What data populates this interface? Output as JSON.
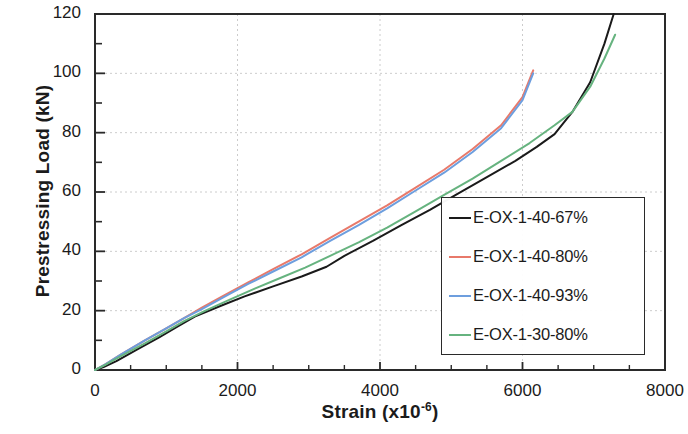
{
  "chart_data": {
    "type": "line",
    "title": "",
    "xlabel": "Strain (x10-6)",
    "xlabel_base": "Strain (x10",
    "xlabel_exponent": "-6",
    "xlabel_close": ")",
    "ylabel": "Prestressing Load (kN)",
    "xlim": [
      0,
      8000
    ],
    "ylim": [
      0,
      120
    ],
    "xticks": [
      0,
      2000,
      4000,
      6000,
      8000
    ],
    "yticks": [
      0,
      20,
      40,
      60,
      80,
      100,
      120
    ],
    "xtick_labels": [
      "0",
      "2000",
      "4000",
      "6000",
      "8000"
    ],
    "ytick_labels": [
      "0",
      "20",
      "40",
      "60",
      "80",
      "100",
      "120"
    ],
    "x_minor_tick_interval": 500,
    "y_minor_tick_interval": 10,
    "grid": true,
    "grid_style": "dotted",
    "grid_color": "#cccccc",
    "legend_position": "center-right",
    "series": [
      {
        "name": "E-OX-1-40-67%",
        "color": "#1a1a1a",
        "points": [
          [
            0,
            0
          ],
          [
            120,
            1.0
          ],
          [
            300,
            3.0
          ],
          [
            600,
            7.0
          ],
          [
            900,
            11.0
          ],
          [
            1150,
            14.5
          ],
          [
            1400,
            18.0
          ],
          [
            1750,
            21.5
          ],
          [
            2100,
            24.8
          ],
          [
            2500,
            28.2
          ],
          [
            2900,
            31.5
          ],
          [
            3250,
            34.8
          ],
          [
            3500,
            38.5
          ],
          [
            3900,
            43.5
          ],
          [
            4300,
            48.8
          ],
          [
            4700,
            54.0
          ],
          [
            5100,
            59.5
          ],
          [
            5500,
            65.0
          ],
          [
            5900,
            70.5
          ],
          [
            6200,
            75.2
          ],
          [
            6450,
            79.5
          ],
          [
            6700,
            87.0
          ],
          [
            6950,
            97.0
          ],
          [
            7150,
            110.0
          ],
          [
            7280,
            120.0
          ]
        ]
      },
      {
        "name": "E-OX-1-40-80%",
        "color": "#e8796a",
        "points": [
          [
            0,
            0
          ],
          [
            150,
            2.0
          ],
          [
            350,
            5.0
          ],
          [
            700,
            10.0
          ],
          [
            1000,
            14.0
          ],
          [
            1250,
            17.5
          ],
          [
            1500,
            21.0
          ],
          [
            1800,
            25.0
          ],
          [
            2150,
            29.5
          ],
          [
            2500,
            34.0
          ],
          [
            2900,
            39.0
          ],
          [
            3300,
            44.5
          ],
          [
            3700,
            50.0
          ],
          [
            4100,
            55.5
          ],
          [
            4500,
            61.5
          ],
          [
            4900,
            67.5
          ],
          [
            5300,
            74.5
          ],
          [
            5700,
            82.5
          ],
          [
            6000,
            92.0
          ],
          [
            6150,
            101.0
          ]
        ]
      },
      {
        "name": "E-OX-1-40-93%",
        "color": "#6d9ede",
        "points": [
          [
            0,
            0
          ],
          [
            150,
            2.0
          ],
          [
            350,
            5.0
          ],
          [
            700,
            10.0
          ],
          [
            1000,
            14.0
          ],
          [
            1250,
            17.5
          ],
          [
            1500,
            20.5
          ],
          [
            1800,
            24.5
          ],
          [
            2150,
            29.0
          ],
          [
            2500,
            33.2
          ],
          [
            2900,
            38.0
          ],
          [
            3300,
            43.5
          ],
          [
            3700,
            48.8
          ],
          [
            4100,
            54.5
          ],
          [
            4500,
            60.5
          ],
          [
            4900,
            66.5
          ],
          [
            5300,
            73.5
          ],
          [
            5700,
            81.5
          ],
          [
            6000,
            91.0
          ],
          [
            6150,
            100.0
          ]
        ]
      },
      {
        "name": "E-OX-1-30-80%",
        "color": "#66b37f",
        "points": [
          [
            0,
            0
          ],
          [
            150,
            1.8
          ],
          [
            350,
            4.5
          ],
          [
            700,
            9.0
          ],
          [
            1000,
            13.0
          ],
          [
            1250,
            16.5
          ],
          [
            1550,
            20.0
          ],
          [
            1900,
            23.8
          ],
          [
            2250,
            27.5
          ],
          [
            2600,
            31.0
          ],
          [
            2950,
            34.5
          ],
          [
            3300,
            38.5
          ],
          [
            3700,
            43.0
          ],
          [
            4100,
            48.0
          ],
          [
            4500,
            53.5
          ],
          [
            4900,
            59.0
          ],
          [
            5300,
            64.5
          ],
          [
            5700,
            70.5
          ],
          [
            6100,
            76.5
          ],
          [
            6450,
            82.5
          ],
          [
            6700,
            87.0
          ],
          [
            6950,
            95.5
          ],
          [
            7150,
            105.0
          ],
          [
            7300,
            113.0
          ]
        ]
      }
    ]
  },
  "legend": {
    "items": [
      {
        "label": "E-OX-1-40-67%",
        "color": "#1a1a1a"
      },
      {
        "label": "E-OX-1-40-80%",
        "color": "#e8796a"
      },
      {
        "label": "E-OX-1-40-93%",
        "color": "#6d9ede"
      },
      {
        "label": "E-OX-1-30-80%",
        "color": "#66b37f"
      }
    ]
  }
}
